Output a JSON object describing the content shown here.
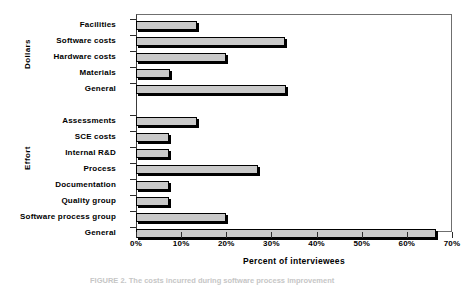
{
  "chart_data": {
    "type": "bar",
    "orientation": "horizontal",
    "title": "",
    "xlabel": "Percent of interviewees",
    "ylabel": "",
    "xlim": [
      0,
      70
    ],
    "xticks": [
      0,
      10,
      20,
      30,
      40,
      50,
      60,
      70
    ],
    "xticklabels": [
      "0%",
      "10%",
      "20%",
      "30%",
      "40%",
      "50%",
      "60%",
      "70%"
    ],
    "grid": false,
    "legend": false,
    "groups": [
      {
        "name": "Dollars",
        "categories": [
          "Facilities",
          "Software costs",
          "Hardware costs",
          "Materials",
          "General"
        ],
        "values": [
          13.5,
          33.0,
          20.0,
          7.5,
          33.3
        ]
      },
      {
        "name": "Effort",
        "categories": [
          "Assessments",
          "SCE costs",
          "Internal R&D",
          "Process",
          "Documentation",
          "Quality group",
          "Software process group",
          "General"
        ],
        "values": [
          13.5,
          7.3,
          7.3,
          27.0,
          7.3,
          7.3,
          20.0,
          66.5
        ]
      }
    ],
    "colors": {
      "bar_fill": "#c9c9c9",
      "bar_edge": "#000000",
      "axis": "#2c2c2c",
      "frame": "#6f6f6f",
      "background": "#ffffff"
    }
  },
  "caption": "FIGURE 2.  The costs incurred during software process improvement"
}
